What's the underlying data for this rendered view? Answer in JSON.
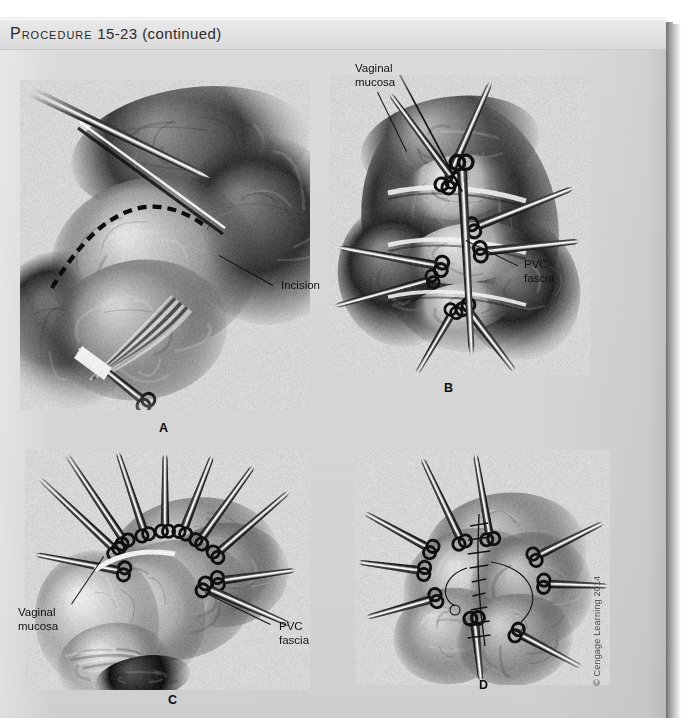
{
  "page": {
    "header": {
      "procedure_label": "Procedure",
      "procedure_number": "15-23",
      "continued": "(continued)"
    },
    "copyright": "© Cengage Learning 2014"
  },
  "figures": [
    {
      "id": "panel-a",
      "letter": "A",
      "caption_subject": "vaginal-wall-incision",
      "labels": [
        {
          "name": "incision-label",
          "text": "Incision"
        }
      ]
    },
    {
      "id": "panel-b",
      "letter": "B",
      "caption_subject": "dissection-with-clamps",
      "labels": [
        {
          "name": "vaginal-mucosa-label",
          "line1": "Vaginal",
          "line2": "mucosa"
        },
        {
          "name": "pvc-fascia-label",
          "line1": "PVC",
          "line2": "fascia"
        }
      ]
    },
    {
      "id": "panel-c",
      "letter": "C",
      "caption_subject": "exposed-fascia-with-clamps",
      "labels": [
        {
          "name": "vaginal-mucosa-label",
          "line1": "Vaginal",
          "line2": "mucosa"
        },
        {
          "name": "pvc-fascia-label",
          "line1": "PVC",
          "line2": "fascia"
        }
      ]
    },
    {
      "id": "panel-d",
      "letter": "D",
      "caption_subject": "fascial-plication-sutures",
      "labels": []
    }
  ]
}
